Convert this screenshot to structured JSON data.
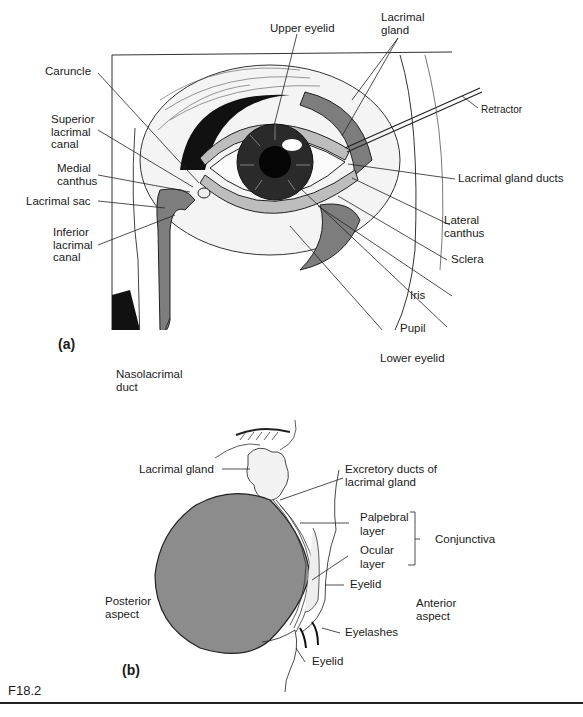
{
  "figure_id": "F18.2",
  "panel_a": {
    "letter": "(a)",
    "labels": {
      "upper_eyelid": "Upper eyelid",
      "lacrimal_gland": "Lacrimal\ngland",
      "retractor": "Retractor",
      "caruncle": "Caruncle",
      "superior_lacrimal_canal": "Superior\nlacrimal\ncanal",
      "medial_canthus": "Medial\ncanthus",
      "lacrimal_sac": "Lacrimal sac",
      "inferior_lacrimal_canal": "Inferior\nlacrimal\ncanal",
      "lacrimal_gland_ducts": "Lacrimal gland ducts",
      "lateral_canthus": "Lateral\ncanthus",
      "sclera": "Sclera",
      "iris": "Iris",
      "pupil": "Pupil",
      "lower_eyelid": "Lower eyelid",
      "nasolacrimal_duct": "Nasolacrimal\nduct"
    }
  },
  "panel_b": {
    "letter": "(b)",
    "labels": {
      "lacrimal_gland": "Lacrimal gland",
      "excretory_ducts": "Excretory ducts of\nlacrimal gland",
      "palpebral_layer": "Palpebral\nlayer",
      "ocular_layer": "Ocular\nlayer",
      "conjunctiva": "Conjunctiva",
      "eyelid_upper": "Eyelid",
      "posterior_aspect": "Posterior\naspect",
      "anterior_aspect": "Anterior\naspect",
      "eyelashes": "Eyelashes",
      "eyelid_lower": "Eyelid"
    }
  },
  "colors": {
    "ink": "#1a1a1a",
    "tissue_gray": "#8a8a8a",
    "eyeball_gray": "#8c8c8c"
  }
}
